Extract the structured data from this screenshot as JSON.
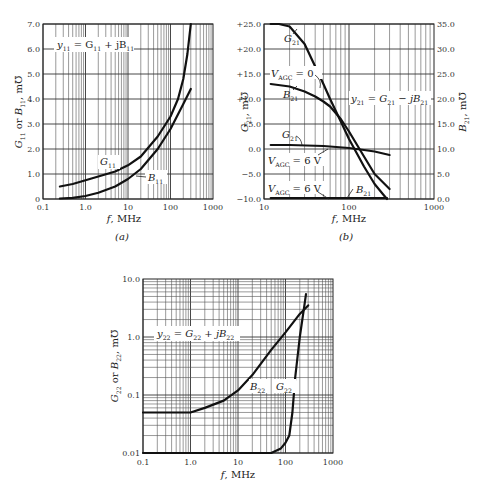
{
  "chart_data": [
    {
      "id": "a",
      "type": "line",
      "caption": "(a)",
      "title": "y11 = G11 + jB11",
      "xlabel": "f, MHz",
      "ylabel": "G11 or B11, m℧",
      "xscale": "log",
      "xlim": [
        0.1,
        1000
      ],
      "ylim": [
        0,
        7.0
      ],
      "xticks": [
        "0.1",
        "1.0",
        "10",
        "100",
        "1000"
      ],
      "yticks": [
        "0",
        "1.0",
        "2.0",
        "3.0",
        "4.0",
        "5.0",
        "6.0",
        "7.0"
      ],
      "grid": true,
      "series": [
        {
          "name": "G11",
          "x": [
            0.25,
            0.5,
            1,
            2,
            5,
            10,
            20,
            50,
            100,
            150,
            200,
            250,
            300
          ],
          "y": [
            0.5,
            0.6,
            0.75,
            0.9,
            1.1,
            1.35,
            1.7,
            2.5,
            3.3,
            4.0,
            4.8,
            5.8,
            7.0
          ]
        },
        {
          "name": "B11",
          "x": [
            0.25,
            0.5,
            1,
            2,
            5,
            10,
            20,
            50,
            100,
            200,
            300
          ],
          "y": [
            0.02,
            0.05,
            0.12,
            0.25,
            0.5,
            0.8,
            1.2,
            2.0,
            2.8,
            3.8,
            4.4
          ]
        }
      ]
    },
    {
      "id": "b",
      "type": "line",
      "caption": "(b)",
      "title": "y21 = G21 − jB21",
      "xlabel": "f, MHz",
      "ylabel": "G21, m℧",
      "ylabel_right": "B21, m℧",
      "xscale": "log",
      "xlim": [
        10,
        1000
      ],
      "ylim": [
        -10.0,
        25.0
      ],
      "ylim_right": [
        0.0,
        35.0
      ],
      "xticks": [
        "10",
        "100",
        "1000"
      ],
      "yticks": [
        "−10.0",
        "−5.0",
        "0.0",
        "+5.0",
        "+10.0",
        "+15.0",
        "+20.0",
        "+25.0"
      ],
      "yticks_right": [
        "0.0",
        "5.0",
        "10.0",
        "15.0",
        "20.0",
        "25.0",
        "30.0",
        "35.0"
      ],
      "grid": true,
      "annotations": [
        "VAGC = 0",
        "VAGC = 6 V",
        "VAGC = 6 V",
        "G21",
        "B21",
        "G21",
        "B21"
      ],
      "series": [
        {
          "name": "G21 (VAGC = 0)",
          "axis": "left",
          "x": [
            12,
            15,
            20,
            30,
            40,
            50,
            60,
            80,
            100,
            150,
            200,
            250,
            280
          ],
          "y": [
            25.0,
            25.0,
            24.5,
            21.0,
            16.5,
            13.0,
            10.0,
            5.5,
            2.0,
            -3.5,
            -7.0,
            -9.0,
            -10.0
          ]
        },
        {
          "name": "B21 (VAGC = 0)",
          "axis": "right",
          "x": [
            12,
            20,
            30,
            40,
            50,
            60,
            80,
            100,
            150,
            200,
            300
          ],
          "y": [
            23.0,
            22.5,
            21.5,
            20.5,
            19.5,
            18.5,
            16.0,
            13.5,
            8.5,
            5.0,
            2.0
          ]
        },
        {
          "name": "G21 (VAGC = 6 V)",
          "axis": "left",
          "x": [
            12,
            20,
            50,
            100,
            150,
            200,
            300
          ],
          "y": [
            0.8,
            0.8,
            0.6,
            0.2,
            -0.2,
            -0.5,
            -1.2
          ]
        },
        {
          "name": "B21 (VAGC = 6 V)",
          "axis": "right",
          "x": [
            12,
            50,
            100,
            200,
            280
          ],
          "y": [
            0.2,
            0.2,
            0.2,
            0.2,
            0.2
          ]
        }
      ]
    },
    {
      "id": "c",
      "type": "line",
      "caption": "",
      "title": "y22 = G22 + jB22",
      "xlabel": "f, MHz",
      "ylabel": "G22 or B22, m℧",
      "xscale": "log",
      "yscale": "log",
      "xlim": [
        0.1,
        1000
      ],
      "ylim": [
        0.01,
        10.0
      ],
      "xticks": [
        "0.1",
        "1.0",
        "10",
        "100",
        "1000"
      ],
      "yticks": [
        "0.01",
        "0.1",
        "1.0",
        "10.0"
      ],
      "grid": true,
      "series": [
        {
          "name": "B22",
          "x": [
            0.1,
            0.5,
            1.0,
            2,
            5,
            10,
            20,
            50,
            100,
            200,
            300
          ],
          "y": [
            0.05,
            0.05,
            0.05,
            0.06,
            0.08,
            0.12,
            0.22,
            0.6,
            1.2,
            2.5,
            3.5
          ]
        },
        {
          "name": "G22",
          "x": [
            0.1,
            1,
            10,
            50,
            80,
            100,
            120,
            140,
            160,
            200,
            250,
            270
          ],
          "y": [
            0.01,
            0.01,
            0.01,
            0.01,
            0.012,
            0.015,
            0.02,
            0.05,
            0.2,
            1.0,
            3.5,
            5.5
          ]
        }
      ]
    }
  ],
  "labels": {
    "a": {
      "caption": "(a)",
      "xlabel": "f, MHz",
      "title_y": "y",
      "title_sub": "11",
      "eq": " = G",
      "eq_sub1": "11",
      "eq2": " + jB",
      "eq_sub2": "11",
      "g_label": "G",
      "g_sub": "11",
      "b_label": "B",
      "b_sub": "11"
    },
    "b": {
      "caption": "(b)",
      "xlabel": "f, MHz",
      "agc0": "V",
      "agc_sub": "AGC",
      "agc0_val": " = 0",
      "agc6_val": " = 6 V",
      "g_label": "G",
      "g_sub": "21",
      "b_label": "B",
      "b_sub": "21",
      "ylabel_left": "G",
      "ylabel_left_sub": "21",
      "ylabel_unit": ", m℧",
      "ylabel_right": "B",
      "ylabel_right_sub": "21"
    },
    "c": {
      "xlabel": "f, MHz",
      "g_label": "G",
      "g_sub": "22",
      "b_label": "B",
      "b_sub": "22"
    }
  }
}
